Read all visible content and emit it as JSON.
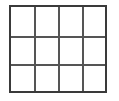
{
  "grid": {
    "rows": 3,
    "columns": 4,
    "border_color": "#3a3a3a",
    "line_color": "#555555",
    "background": "#ffffff",
    "cells": [
      [
        "",
        "",
        "",
        ""
      ],
      [
        "",
        "",
        "",
        ""
      ],
      [
        "",
        "",
        "",
        ""
      ]
    ]
  }
}
